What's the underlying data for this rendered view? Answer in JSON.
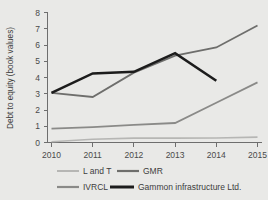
{
  "chart_data": {
    "type": "line",
    "title": "",
    "xlabel": "",
    "ylabel": "Debt to equity (book values)",
    "categories": [
      "2010",
      "2011",
      "2012",
      "2013",
      "2014",
      "2015"
    ],
    "x": [
      2010,
      2011,
      2012,
      2013,
      2014,
      2015
    ],
    "xlim": [
      2010,
      2015
    ],
    "ylim": [
      0,
      8
    ],
    "yticks": [
      0,
      1,
      2,
      3,
      4,
      5,
      6,
      7,
      8
    ],
    "ytick_labels": [
      "0",
      "1",
      "2",
      "3",
      "4",
      "5",
      "6",
      "7",
      "8"
    ],
    "grid": false,
    "legend_position": "bottom",
    "series": [
      {
        "name": "L and T",
        "color": "#b6b6b4",
        "width": 1.6,
        "values": [
          0.05,
          0.2,
          0.27,
          0.27,
          0.28,
          0.33
        ]
      },
      {
        "name": "GMR",
        "color": "#6e6e6c",
        "width": 1.8,
        "values": [
          3.05,
          2.8,
          4.3,
          5.35,
          5.85,
          7.2
        ]
      },
      {
        "name": "IVRCL",
        "color": "#8a8a88",
        "width": 1.8,
        "values": [
          0.85,
          0.95,
          1.08,
          1.2,
          2.45,
          3.7
        ]
      },
      {
        "name": "Gammon infrastructure Ltd.",
        "color": "#1c1c1c",
        "width": 2.6,
        "values": [
          3.05,
          4.25,
          4.35,
          5.5,
          3.8,
          null
        ]
      }
    ]
  },
  "legend": {
    "items": [
      {
        "label": "L and T",
        "series": 0
      },
      {
        "label": "GMR",
        "series": 1
      },
      {
        "label": "IVRCL",
        "series": 2
      },
      {
        "label": "Gammon infrastructure Ltd.",
        "series": 3
      }
    ]
  },
  "colors": {
    "background": "#e9e9e7",
    "axis": "#6e6e6e",
    "text": "#3d3d3d"
  }
}
